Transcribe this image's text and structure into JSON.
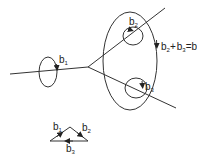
{
  "diagram": {
    "labels": {
      "b1": {
        "base": "b",
        "sub": "1"
      },
      "b2": {
        "base": "b",
        "sub": "2"
      },
      "b3": {
        "base": "b",
        "sub": "3"
      },
      "relation": {
        "parts": [
          {
            "base": "b",
            "sub": "2"
          },
          {
            "op": "+"
          },
          {
            "base": "b",
            "sub": "3"
          },
          {
            "op": "="
          },
          {
            "base": "b",
            "sub": "1"
          }
        ]
      }
    },
    "triangle": {
      "labels": {
        "left": {
          "base": "b",
          "sub": "1"
        },
        "right": {
          "base": "b",
          "sub": "2"
        },
        "bottom": {
          "base": "b",
          "sub": "3"
        }
      }
    },
    "colors": {
      "stroke": "#333333",
      "text": "#222222",
      "background": "#ffffff"
    }
  }
}
